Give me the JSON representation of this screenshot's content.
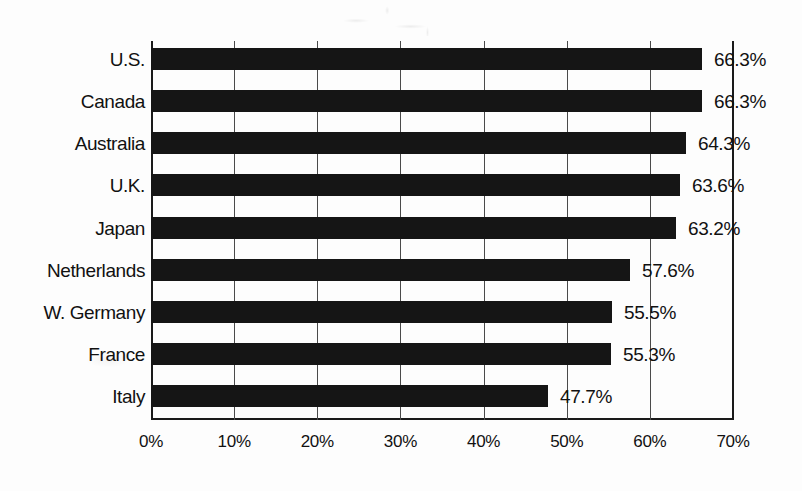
{
  "chart_data": {
    "type": "bar",
    "orientation": "horizontal",
    "title": "",
    "subtitle": "",
    "xlabel": "",
    "ylabel": "",
    "categories": [
      "U.S.",
      "Canada",
      "Australia",
      "U.K.",
      "Japan",
      "Netherlands",
      "W. Germany",
      "France",
      "Italy"
    ],
    "values": [
      66.3,
      66.3,
      64.3,
      63.6,
      63.2,
      57.6,
      55.5,
      55.3,
      47.7
    ],
    "value_labels": [
      "66.3%",
      "66.3%",
      "64.3%",
      "63.6%",
      "63.2%",
      "57.6%",
      "55.5%",
      "55.3%",
      "47.7%"
    ],
    "xlim": [
      0,
      70
    ],
    "xticks": [
      0,
      10,
      20,
      30,
      40,
      50,
      60,
      70
    ],
    "xtick_labels": [
      "0%",
      "10%",
      "20%",
      "30%",
      "40%",
      "50%",
      "60%",
      "70%"
    ],
    "grid": true,
    "grid_axis": "x",
    "legend": false,
    "legend_position": "none",
    "bar_color": "#151515",
    "axis_color": "#1a1a1a",
    "grid_color": "#4a4a4a",
    "background_color": "#fdfdfd",
    "data_labels_shown": true
  }
}
